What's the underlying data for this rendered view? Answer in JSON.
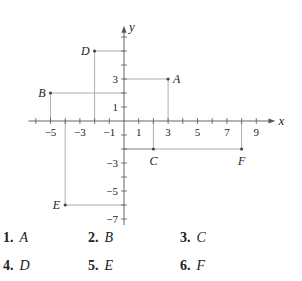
{
  "chart_data": {
    "type": "scatter",
    "title": "",
    "xlabel": "x",
    "ylabel": "y",
    "xlim": [
      -6.5,
      10.3
    ],
    "ylim": [
      -7.5,
      6.8
    ],
    "x_ticks": [
      -6,
      -5,
      -4,
      -3,
      -2,
      -1,
      1,
      2,
      3,
      4,
      5,
      6,
      7,
      8,
      9
    ],
    "x_tick_labels": [
      "-5",
      "-3",
      "-1",
      "1",
      "3",
      "5",
      "7",
      "9"
    ],
    "x_tick_label_values": [
      -5,
      -3,
      -1,
      1,
      3,
      5,
      7,
      9
    ],
    "y_ticks": [
      -7,
      -6,
      -5,
      -4,
      -3,
      -2,
      -1,
      1,
      2,
      3,
      4,
      5,
      6
    ],
    "y_tick_labels": [
      "3",
      "1",
      "-3",
      "-5",
      "-7"
    ],
    "y_tick_label_values": [
      3,
      1,
      -3,
      -5,
      -7
    ],
    "grid": false,
    "legend": null,
    "points": [
      {
        "label": "A",
        "x": 3,
        "y": 3,
        "label_pos": "right"
      },
      {
        "label": "B",
        "x": -5,
        "y": 2,
        "label_pos": "left"
      },
      {
        "label": "C",
        "x": 2,
        "y": -2,
        "label_pos": "below"
      },
      {
        "label": "D",
        "x": -2,
        "y": 5,
        "label_pos": "left"
      },
      {
        "label": "E",
        "x": -4,
        "y": -6,
        "label_pos": "left"
      },
      {
        "label": "F",
        "x": 8,
        "y": -2,
        "label_pos": "below"
      }
    ],
    "projection_lines": true
  },
  "problems": [
    {
      "num": "1.",
      "label": "A"
    },
    {
      "num": "2.",
      "label": "B"
    },
    {
      "num": "3.",
      "label": "C"
    },
    {
      "num": "4.",
      "label": "D"
    },
    {
      "num": "5.",
      "label": "E"
    },
    {
      "num": "6.",
      "label": "F"
    }
  ]
}
